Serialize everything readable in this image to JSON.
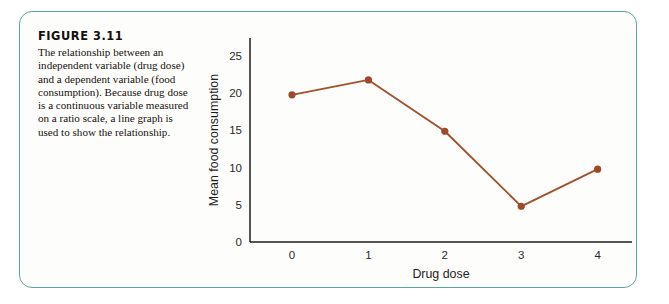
{
  "figure": {
    "label": "FIGURE 3.11",
    "caption": "The relationship between an independent variable (drug dose) and a dependent variable (food consumption). Because drug dose is a continuous variable measured on a ratio scale, a line graph is used to show the relationship.",
    "border_color": "#5aa69c",
    "background_color": "#fdfdfb"
  },
  "chart_data": {
    "type": "line",
    "title": "",
    "xlabel": "Drug dose",
    "ylabel": "Mean food consumption",
    "x": [
      0,
      1,
      2,
      3,
      4
    ],
    "values": [
      19.8,
      21.8,
      14.9,
      4.8,
      9.8
    ],
    "xticks": [
      "0",
      "1",
      "2",
      "3",
      "4"
    ],
    "yticks": [
      "0",
      "5",
      "10",
      "15",
      "20",
      "25"
    ],
    "xlim": [
      -0.55,
      4.45
    ],
    "ylim": [
      0,
      26.5
    ],
    "grid": false,
    "legend": false,
    "series_color": "#a0522d",
    "marker": "circle"
  }
}
